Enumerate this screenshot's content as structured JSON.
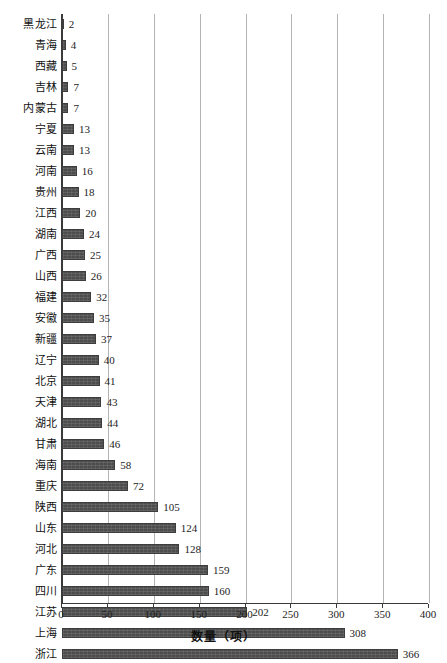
{
  "chart_data": {
    "type": "bar",
    "orientation": "horizontal",
    "title": "",
    "xlabel": "数量（项）",
    "ylabel": "",
    "xlim": [
      0,
      400
    ],
    "xticks": [
      0,
      50,
      100,
      150,
      200,
      250,
      300,
      350,
      400
    ],
    "grid": "vertical",
    "legend": "none",
    "bar_color": "#4d4d4d",
    "categories": [
      "黑龙江",
      "青海",
      "西藏",
      "吉林",
      "内蒙古",
      "宁夏",
      "云南",
      "河南",
      "贵州",
      "江西",
      "湖南",
      "广西",
      "山西",
      "福建",
      "安徽",
      "新疆",
      "辽宁",
      "北京",
      "天津",
      "湖北",
      "甘肃",
      "海南",
      "重庆",
      "陕西",
      "山东",
      "河北",
      "广东",
      "四川",
      "江苏",
      "上海",
      "浙江"
    ],
    "values": [
      2,
      4,
      5,
      7,
      7,
      13,
      13,
      16,
      18,
      20,
      24,
      25,
      26,
      32,
      35,
      37,
      40,
      41,
      43,
      44,
      46,
      58,
      72,
      105,
      124,
      128,
      159,
      160,
      202,
      308,
      366
    ]
  }
}
